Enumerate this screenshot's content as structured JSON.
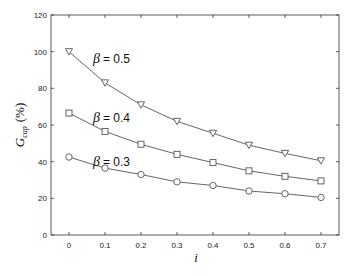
{
  "chart_data": {
    "type": "line",
    "title": "",
    "xlabel": "i",
    "ylabel": "G_cap (%)",
    "ylabel_main": "G",
    "ylabel_sub": "cap",
    "ylabel_unit": "(%)",
    "x": [
      0,
      0.1,
      0.2,
      0.3,
      0.4,
      0.5,
      0.6,
      0.7
    ],
    "xlim": [
      -0.05,
      0.75
    ],
    "ylim": [
      0,
      120
    ],
    "xticks": [
      "0",
      "0.1",
      "0.2",
      "0.3",
      "0.4",
      "0.5",
      "0.6",
      "0.7"
    ],
    "yticks": [
      "0",
      "20",
      "40",
      "60",
      "80",
      "100",
      "120"
    ],
    "grid": false,
    "legend": "none (inline annotations)",
    "series": [
      {
        "name": "β = 0.5",
        "marker": "triangle-down",
        "values": [
          100,
          83,
          71,
          62,
          55.5,
          49,
          44.5,
          40.5
        ],
        "annotation": {
          "beta": "β",
          "text": "= 0.5",
          "x": 0.05,
          "y": 96
        }
      },
      {
        "name": "β = 0.4",
        "marker": "square",
        "values": [
          66.5,
          56.5,
          49.5,
          44,
          39.5,
          35,
          32,
          29.5
        ],
        "annotation": {
          "beta": "β",
          "text": "= 0.4",
          "x": 0.05,
          "y": 64
        }
      },
      {
        "name": "β = 0.3",
        "marker": "circle",
        "values": [
          42.5,
          36.5,
          33,
          29,
          27,
          24,
          22.5,
          20.5
        ],
        "annotation": {
          "beta": "β",
          "text": "= 0.3",
          "x": 0.05,
          "y": 40
        }
      }
    ]
  },
  "colors": {
    "line": "#555555",
    "axis": "#333333",
    "background": "#ffffff"
  }
}
